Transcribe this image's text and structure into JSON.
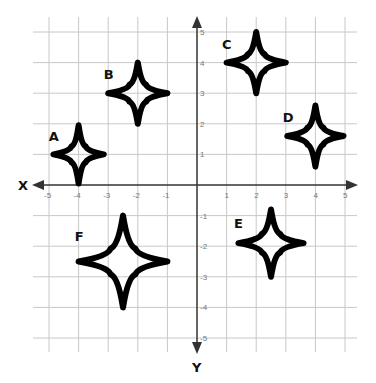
{
  "diagram": {
    "type": "coordinate-plane",
    "x_axis_label": "X",
    "y_axis_label": "Y",
    "x_range": [
      -5,
      5
    ],
    "y_range": [
      -5,
      5
    ],
    "x_ticks": [
      "-5",
      "-4",
      "-3",
      "-2",
      "-1",
      "1",
      "2",
      "3",
      "4",
      "5"
    ],
    "y_ticks": [
      "5",
      "4",
      "3",
      "2",
      "1",
      "-1",
      "-2",
      "-3",
      "-4",
      "-5"
    ],
    "grid": true,
    "stars": [
      {
        "label": "A",
        "center": [
          -4,
          1
        ],
        "rx": 0.85,
        "ry": 0.95
      },
      {
        "label": "B",
        "center": [
          -2,
          3
        ],
        "rx": 1.0,
        "ry": 1.0
      },
      {
        "label": "C",
        "center": [
          2,
          4
        ],
        "rx": 1.0,
        "ry": 1.0
      },
      {
        "label": "D",
        "center": [
          4,
          1.6
        ],
        "rx": 0.95,
        "ry": 1.0
      },
      {
        "label": "E",
        "center": [
          2.5,
          -1.9
        ],
        "rx": 1.1,
        "ry": 1.1
      },
      {
        "label": "F",
        "center": [
          -2.5,
          -2.5
        ],
        "rx": 1.5,
        "ry": 1.5
      }
    ]
  }
}
